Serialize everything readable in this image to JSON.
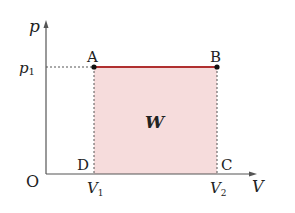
{
  "diagram": {
    "type": "pV-diagram",
    "axes": {
      "y_label": "p",
      "x_label": "V",
      "origin_label": "O"
    },
    "ticks": {
      "p1": {
        "base": "p",
        "sub": "1"
      },
      "V1": {
        "base": "V",
        "sub": "1"
      },
      "V2": {
        "base": "V",
        "sub": "2"
      }
    },
    "points": {
      "A": "A",
      "B": "B",
      "C": "C",
      "D": "D"
    },
    "area_label": "W",
    "colors": {
      "area_fill": "#f6dcdc",
      "process_line": "#b03030",
      "axis": "#555555",
      "dashed": "#555555",
      "text": "#222222"
    }
  }
}
